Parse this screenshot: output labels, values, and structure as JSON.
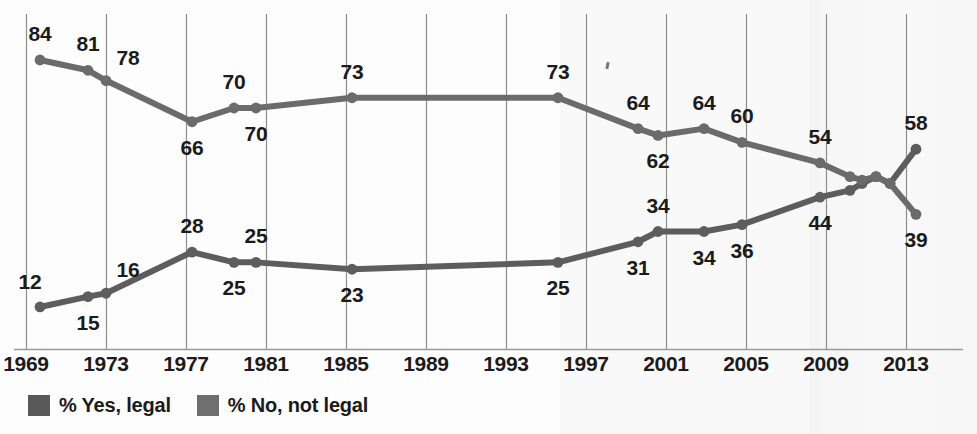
{
  "chart_data": {
    "type": "line",
    "title": "",
    "subtitle": "",
    "xlabel": "",
    "ylabel": "",
    "xlim": [
      1969,
      2014
    ],
    "ylim": [
      0,
      100
    ],
    "grid": true,
    "legend_position": "bottom-left",
    "tick_labels": [
      "1969",
      "1973",
      "1977",
      "1981",
      "1985",
      "1989",
      "1993",
      "1997",
      "2001",
      "2005",
      "2009",
      "2013"
    ],
    "tick_years": [
      1969,
      1973,
      1977,
      1981,
      1985,
      1989,
      1993,
      1997,
      2001,
      2005,
      2009,
      2013
    ],
    "series": [
      {
        "name": "% Yes, legal",
        "color": "#5d5d5d",
        "x": [
          1969.7,
          1972.1,
          1973.0,
          1977.3,
          1979.4,
          1980.5,
          1985.3,
          1995.6,
          1999.6,
          2000.6,
          2002.9,
          2004.8,
          2008.7,
          2010.2,
          2010.8,
          2011.5,
          2012.2,
          2013.5
        ],
        "values": [
          12,
          15,
          16,
          28,
          25,
          25,
          23,
          25,
          31,
          34,
          34,
          36,
          44,
          46,
          48,
          50,
          48,
          58
        ],
        "labels": [
          {
            "text": "12",
            "value": 12,
            "x": 1969.7,
            "pos": "above-left"
          },
          {
            "text": "15",
            "value": 15,
            "x": 1972.1,
            "pos": "below"
          },
          {
            "text": "16",
            "value": 16,
            "x": 1973.0,
            "pos": "above-right"
          },
          {
            "text": "28",
            "value": 28,
            "x": 1977.3,
            "pos": "above"
          },
          {
            "text": "25",
            "value": 25,
            "x": 1979.4,
            "pos": "below"
          },
          {
            "text": "25",
            "value": 25,
            "x": 1980.5,
            "pos": "above"
          },
          {
            "text": "23",
            "value": 23,
            "x": 1985.3,
            "pos": "below"
          },
          {
            "text": "25",
            "value": 25,
            "x": 1995.6,
            "pos": "below"
          },
          {
            "text": "31",
            "value": 31,
            "x": 1999.6,
            "pos": "below"
          },
          {
            "text": "34",
            "value": 34,
            "x": 2000.6,
            "pos": "above"
          },
          {
            "text": "34",
            "value": 34,
            "x": 2002.9,
            "pos": "below"
          },
          {
            "text": "36",
            "value": 36,
            "x": 2004.8,
            "pos": "below"
          },
          {
            "text": "44",
            "value": 44,
            "x": 2008.7,
            "pos": "below"
          },
          {
            "text": "58",
            "value": 58,
            "x": 2013.5,
            "pos": "above"
          }
        ]
      },
      {
        "name": "% No, not legal",
        "color": "#6b6b6b",
        "x": [
          1969.7,
          1972.1,
          1973.0,
          1977.3,
          1979.4,
          1980.5,
          1985.3,
          1995.6,
          1999.6,
          2000.6,
          2002.9,
          2004.8,
          2008.7,
          2010.2,
          2010.8,
          2011.5,
          2012.2,
          2013.5
        ],
        "values": [
          84,
          81,
          78,
          66,
          70,
          70,
          73,
          73,
          64,
          62,
          64,
          60,
          54,
          50,
          49,
          50,
          48,
          39
        ],
        "labels": [
          {
            "text": "84",
            "value": 84,
            "x": 1969.7,
            "pos": "above"
          },
          {
            "text": "81",
            "value": 81,
            "x": 1972.1,
            "pos": "above"
          },
          {
            "text": "78",
            "value": 78,
            "x": 1973.0,
            "pos": "above-right"
          },
          {
            "text": "66",
            "value": 66,
            "x": 1977.3,
            "pos": "below"
          },
          {
            "text": "70",
            "value": 70,
            "x": 1979.4,
            "pos": "above"
          },
          {
            "text": "70",
            "value": 70,
            "x": 1980.5,
            "pos": "below"
          },
          {
            "text": "73",
            "value": 73,
            "x": 1985.3,
            "pos": "above"
          },
          {
            "text": "73",
            "value": 73,
            "x": 1995.6,
            "pos": "above"
          },
          {
            "text": "64",
            "value": 64,
            "x": 1999.6,
            "pos": "above"
          },
          {
            "text": "62",
            "value": 62,
            "x": 2000.6,
            "pos": "below"
          },
          {
            "text": "64",
            "value": 64,
            "x": 2002.9,
            "pos": "above"
          },
          {
            "text": "60",
            "value": 60,
            "x": 2004.8,
            "pos": "above"
          },
          {
            "text": "54",
            "value": 54,
            "x": 2008.7,
            "pos": "above"
          },
          {
            "text": "39",
            "value": 39,
            "x": 2013.5,
            "pos": "below"
          }
        ]
      }
    ]
  },
  "legend": {
    "items": [
      {
        "label": "% Yes, legal",
        "color": "#595959"
      },
      {
        "label": "% No, not legal",
        "color": "#6f6f6f"
      }
    ]
  },
  "axis": {
    "gridline_color": "#8e8e8e",
    "baseline_color": "#9a9a9a"
  }
}
